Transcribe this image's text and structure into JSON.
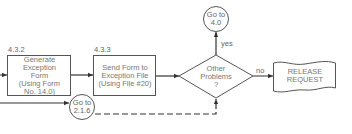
{
  "flowchart": {
    "process_1": {
      "id": "4.3.2",
      "lines": [
        "Generate",
        "Exception",
        "Form",
        "(Using Form",
        "No. 14.0)"
      ]
    },
    "process_2": {
      "id": "4.3.3",
      "lines": [
        "Send Form to",
        "Exception File",
        "(Using File #20)"
      ]
    },
    "decision": {
      "lines": [
        "Other",
        "Problems",
        "?"
      ]
    },
    "connector_top": {
      "lines": [
        "Go to",
        "4.0"
      ]
    },
    "connector_bottom": {
      "lines": [
        "Go to",
        "2.1.6"
      ]
    },
    "document": {
      "lines": [
        "RELEASE",
        "REQUEST"
      ]
    },
    "edge_labels": {
      "yes": "yes",
      "no": "no"
    }
  },
  "colors": {
    "line": "#333333",
    "text": "#666666",
    "background": "#ffffff"
  }
}
